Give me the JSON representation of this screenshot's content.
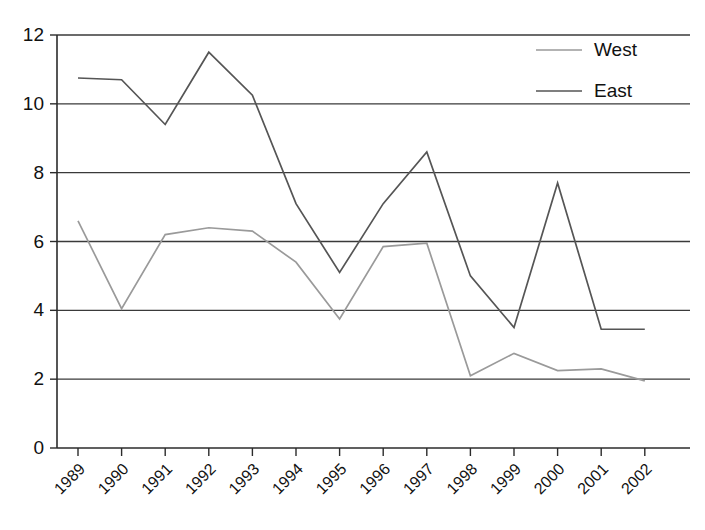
{
  "chart_data": {
    "type": "line",
    "title": "",
    "subtitle": "",
    "xlabel": "",
    "ylabel": "",
    "categories": [
      "1989",
      "1990",
      "1991",
      "1992",
      "1993",
      "1994",
      "1995",
      "1996",
      "1997",
      "1998",
      "1999",
      "2000",
      "2001",
      "2002"
    ],
    "series": [
      {
        "name": "West",
        "color": "#9a9a9a",
        "values": [
          6.6,
          4.05,
          6.2,
          6.4,
          6.3,
          5.4,
          3.75,
          5.85,
          5.95,
          2.1,
          2.75,
          2.25,
          2.3,
          1.95
        ]
      },
      {
        "name": "East",
        "color": "#555555",
        "values": [
          10.75,
          10.7,
          9.4,
          11.5,
          10.25,
          7.1,
          5.1,
          7.1,
          8.6,
          5.0,
          3.5,
          7.7,
          3.45,
          3.45
        ]
      }
    ],
    "ylim": [
      0,
      12
    ],
    "ytick_values": [
      0,
      2,
      4,
      6,
      8,
      10,
      12
    ],
    "ytick_labels": [
      "0",
      "2",
      "4",
      "6",
      "8",
      "10",
      "12"
    ],
    "grid": true,
    "grid_axis": "y",
    "legend_position": "top-right",
    "xtick_rotation": 45
  },
  "legend": {
    "entries": [
      {
        "label": "West"
      },
      {
        "label": "East"
      }
    ]
  },
  "axes": {
    "y_ticks": [
      "0",
      "2",
      "4",
      "6",
      "8",
      "10",
      "12"
    ],
    "x_ticks": [
      "1989",
      "1990",
      "1991",
      "1992",
      "1993",
      "1994",
      "1995",
      "1996",
      "1997",
      "1998",
      "1999",
      "2000",
      "2001",
      "2002"
    ]
  }
}
